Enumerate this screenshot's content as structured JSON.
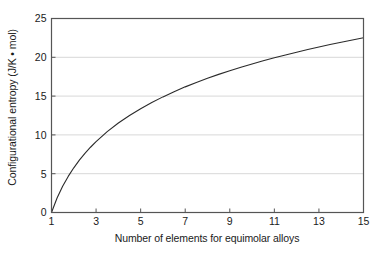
{
  "chart_data": {
    "type": "line",
    "title": "",
    "subtitle": "",
    "xlabel": "Number of elements for equimolar alloys",
    "ylabel": "Configurational entropy (J/K • mol)",
    "xlim": [
      1,
      15
    ],
    "ylim": [
      0,
      25
    ],
    "xticks": [
      1,
      3,
      5,
      7,
      9,
      11,
      13,
      15
    ],
    "xticklabels": [
      "1",
      "3",
      "5",
      "7",
      "9",
      "11",
      "13",
      "15"
    ],
    "yticks": [
      0,
      5,
      10,
      15,
      20,
      25
    ],
    "yticklabels": [
      "0",
      "5",
      "10",
      "15",
      "20",
      "25"
    ],
    "grid": "horizontal",
    "grid_color": "#d8d8d8",
    "legend": "none",
    "line_color": "#2b2b2b",
    "line_width": 1.1,
    "axis_color": "#555555",
    "background": "#ffffff",
    "relation": "S = R ln(n), R = 8.314 J/K·mol",
    "x": [
      1,
      1.25,
      1.5,
      1.75,
      2,
      2.25,
      2.5,
      2.75,
      3,
      3.5,
      4,
      4.5,
      5,
      5.5,
      6,
      6.5,
      7,
      7.5,
      8,
      8.5,
      9,
      9.5,
      10,
      10.5,
      11,
      11.5,
      12,
      12.5,
      13,
      13.5,
      14,
      14.5,
      15
    ],
    "y": [
      0.0,
      1.86,
      3.37,
      4.65,
      5.76,
      6.74,
      7.62,
      8.41,
      9.13,
      10.42,
      11.53,
      12.5,
      13.38,
      14.17,
      14.9,
      15.57,
      16.19,
      16.76,
      17.29,
      17.8,
      18.27,
      18.72,
      19.14,
      19.55,
      19.93,
      20.3,
      20.66,
      21.0,
      21.32,
      21.64,
      21.94,
      22.23,
      22.51
    ],
    "annotations": []
  }
}
